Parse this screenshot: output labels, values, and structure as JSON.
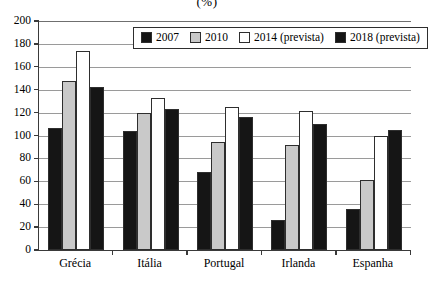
{
  "chart_data": {
    "type": "bar",
    "title": "(%)",
    "xlabel": "",
    "ylabel": "",
    "ylim": [
      0,
      200
    ],
    "ytick_step": 20,
    "yticks": [
      200,
      180,
      160,
      140,
      120,
      100,
      80,
      60,
      40,
      20,
      0
    ],
    "grid": true,
    "legend_position": "top-center-inside",
    "categories": [
      "Grécia",
      "Itália",
      "Portugal",
      "Irlanda",
      "Espanha"
    ],
    "series": [
      {
        "name": "2007",
        "color": "#151515",
        "values": [
          107,
          104,
          68,
          26,
          36
        ]
      },
      {
        "name": "2010",
        "color": "#c9c9c9",
        "values": [
          148,
          120,
          94,
          92,
          61
        ]
      },
      {
        "name": "2014 (prevista)",
        "color": "#ffffff",
        "values": [
          174,
          133,
          125,
          121,
          100
        ]
      },
      {
        "name": "2018 (prevista)",
        "color": "#151515",
        "values": [
          142,
          123,
          116,
          110,
          105
        ]
      }
    ]
  },
  "legend": {
    "items": [
      {
        "label": "2007"
      },
      {
        "label": "2010"
      },
      {
        "label": "2014 (prevista)"
      },
      {
        "label": "2018 (prevista)"
      }
    ]
  }
}
